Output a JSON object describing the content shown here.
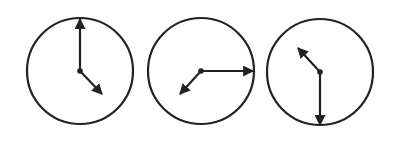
{
  "figure": {
    "stroke_color": "#222222",
    "background": "#ffffff",
    "clocks": [
      {
        "name": "clock-1",
        "time": "4:00",
        "hour_hand_angle_deg": 120,
        "minute_hand_angle_deg": 0
      },
      {
        "name": "clock-2",
        "time": "7:15",
        "hour_hand_angle_deg": 218,
        "minute_hand_angle_deg": 90
      },
      {
        "name": "clock-3",
        "time": "10:30",
        "hour_hand_angle_deg": 315,
        "minute_hand_angle_deg": 180
      }
    ]
  }
}
